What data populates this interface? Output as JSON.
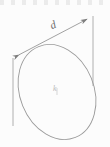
{
  "figure": {
    "background_color": "#fcfcfc",
    "stroke_color": "#8a8a8a",
    "stroke_color_light": "#b9b9b9",
    "width": 110,
    "height": 147,
    "labels": {
      "dimension": "d",
      "center": "k"
    },
    "ellipse": {
      "center_x": 57,
      "center_y": 92,
      "radius_x": 37,
      "radius_y": 49,
      "rotation_deg": -22
    },
    "dimension_line": {
      "x1": 13,
      "y1": 58,
      "x2": 93,
      "y2": 16,
      "arrow_start": true,
      "arrow_end": true
    },
    "extension_lines": [
      {
        "x1": 13,
        "y1": 58,
        "x2": 13,
        "y2": 126
      },
      {
        "x1": 93,
        "y1": 16,
        "x2": 93,
        "y2": 86
      }
    ]
  }
}
